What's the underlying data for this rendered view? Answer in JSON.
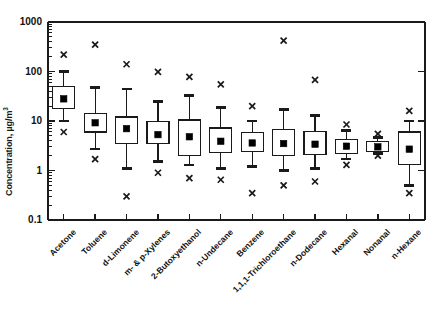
{
  "chart_data": {
    "type": "box",
    "title": "",
    "xlabel": "",
    "ylabel": "Concentration, µg/m",
    "ylabel_sup": "3",
    "yscale": "log",
    "ylim": [
      0.1,
      1000
    ],
    "ytick_labels": [
      "1000",
      "100",
      "10",
      "1",
      "0.1"
    ],
    "ytick_values": [
      1000,
      100,
      10,
      1,
      0.1
    ],
    "grid": false,
    "legend": "none",
    "categories": [
      "Acetone",
      "Toluene",
      "d-Limonene",
      "m- & p-Xylenes",
      "2-Butoxyethanol",
      "n-Undecane",
      "Benzene",
      "1,1,1-Trichloroethane",
      "n-Dodecane",
      "Hexanal",
      "Nonanal",
      "n-Hexane"
    ],
    "series": [
      {
        "name": "Acetone",
        "outlier_high": 220,
        "whisker_high": 100,
        "q3": 50,
        "median": 28,
        "q1": 18,
        "whisker_low": 10,
        "outlier_low": 6.0
      },
      {
        "name": "Toluene",
        "outlier_high": 350,
        "whisker_high": 48,
        "q3": 14,
        "median": 9.2,
        "q1": 6.0,
        "whisker_low": 2.7,
        "outlier_low": 1.7
      },
      {
        "name": "d-Limonene",
        "outlier_high": 140,
        "whisker_high": 44,
        "q3": 12,
        "median": 7.0,
        "q1": 3.5,
        "whisker_low": 1.1,
        "outlier_low": 0.3
      },
      {
        "name": "m- & p-Xylenes",
        "outlier_high": 98,
        "whisker_high": 25,
        "q3": 9.7,
        "median": 5.3,
        "q1": 3.5,
        "whisker_low": 1.5,
        "outlier_low": 0.9
      },
      {
        "name": "2-Butoxyethanol",
        "outlier_high": 78,
        "whisker_high": 33,
        "q3": 10.5,
        "median": 4.8,
        "q1": 2.0,
        "whisker_low": 1.3,
        "outlier_low": 0.7
      },
      {
        "name": "n-Undecane",
        "outlier_high": 55,
        "whisker_high": 19,
        "q3": 7.2,
        "median": 3.9,
        "q1": 2.3,
        "whisker_low": 1.1,
        "outlier_low": 0.65
      },
      {
        "name": "Benzene",
        "outlier_high": 20,
        "whisker_high": 10,
        "q3": 5.8,
        "median": 3.6,
        "q1": 2.4,
        "whisker_low": 1.2,
        "outlier_low": 0.35
      },
      {
        "name": "1,1,1-Trichloroethane",
        "outlier_high": 420,
        "whisker_high": 17,
        "q3": 6.8,
        "median": 3.5,
        "q1": 2.0,
        "whisker_low": 1.0,
        "outlier_low": 0.5
      },
      {
        "name": "n-Dodecane",
        "outlier_high": 68,
        "whisker_high": 13,
        "q3": 6.2,
        "median": 3.4,
        "q1": 2.1,
        "whisker_low": 1.1,
        "outlier_low": 0.6
      },
      {
        "name": "Hexanal",
        "outlier_high": 8.5,
        "whisker_high": 6.5,
        "q3": 4.3,
        "median": 3.1,
        "q1": 2.2,
        "whisker_low": 1.7,
        "outlier_low": 1.3
      },
      {
        "name": "Nonanal",
        "outlier_high": 5.5,
        "whisker_high": 4.6,
        "q3": 3.8,
        "median": 3.0,
        "q1": 2.4,
        "whisker_low": 2.2,
        "outlier_low": 2.0
      },
      {
        "name": "n-Hexane",
        "outlier_high": 16,
        "whisker_high": 10,
        "q3": 6.0,
        "median": 2.7,
        "q1": 1.3,
        "whisker_low": 0.5,
        "outlier_low": 0.35
      }
    ]
  },
  "style": {
    "line_color": "#1a1a1a",
    "marker_color": "#000000",
    "background": "#ffffff"
  }
}
